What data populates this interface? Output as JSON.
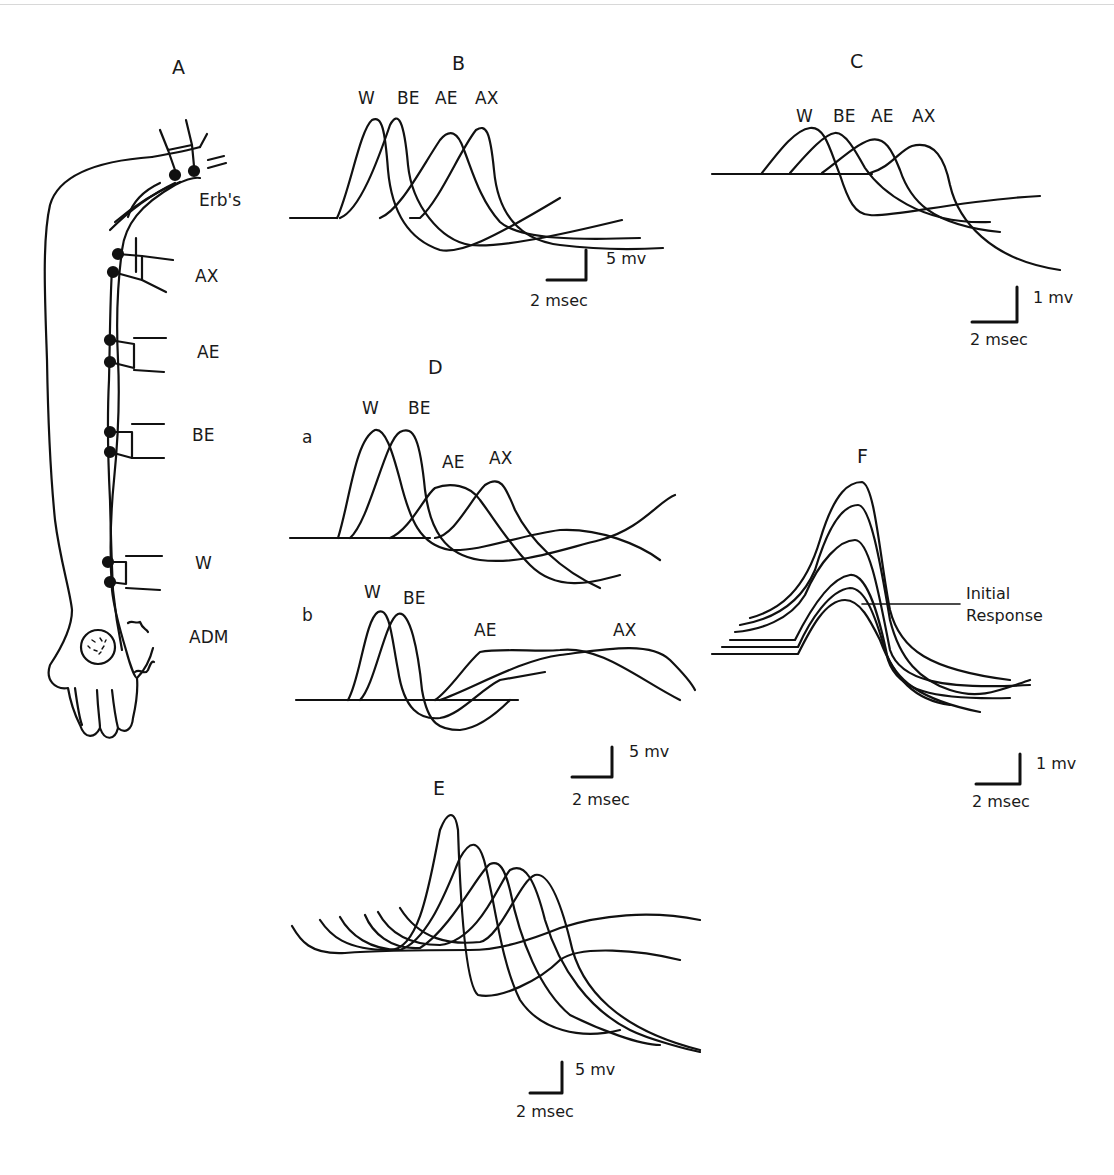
{
  "figure": {
    "panels": {
      "A": {
        "title": "A",
        "sites": [
          "Erb's",
          "AX",
          "AE",
          "BE",
          "W",
          "ADM"
        ]
      },
      "B": {
        "title": "B",
        "trace_labels": [
          "W",
          "BE",
          "AE",
          "AX"
        ],
        "scale": {
          "voltage": "5 mv",
          "time": "2 msec"
        }
      },
      "C": {
        "title": "C",
        "trace_labels": [
          "W",
          "BE",
          "AE",
          "AX"
        ],
        "scale": {
          "voltage": "1 mv",
          "time": "2 msec"
        }
      },
      "D": {
        "title": "D",
        "a": {
          "label": "a",
          "trace_labels": [
            "W",
            "BE",
            "AE",
            "AX"
          ]
        },
        "b": {
          "label": "b",
          "trace_labels": [
            "W",
            "BE",
            "AE",
            "AX"
          ]
        },
        "scale": {
          "voltage": "5 mv",
          "time": "2 msec"
        }
      },
      "E": {
        "title": "E",
        "scale": {
          "voltage": "5 mv",
          "time": "2 msec"
        }
      },
      "F": {
        "title": "F",
        "annotation": [
          "Initial",
          "Response"
        ],
        "scale": {
          "voltage": "1 mv",
          "time": "2 msec"
        }
      }
    },
    "caption_fragment": ""
  },
  "colors": {
    "ink": "#111111",
    "background": "#ffffff"
  }
}
